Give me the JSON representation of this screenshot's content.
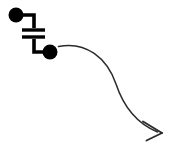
{
  "canvas": {
    "width": 171,
    "height": 157,
    "background_color": "#ffffff",
    "title": "Capacitor symbol with curved arrow"
  },
  "colors": {
    "ink": "#000000",
    "arrow": "#2b2b2b",
    "background": "#ffffff"
  },
  "diagram": {
    "type": "circuit-symbol-with-annotation-arrow",
    "elements": [
      {
        "name": "capacitor-symbol",
        "label": "capacitor",
        "description": "Two parallel horizontal plates with vertical leads"
      },
      {
        "name": "terminal-dot-top-left",
        "label": "terminal node",
        "cx": 16,
        "cy": 15,
        "r": 7.5
      },
      {
        "name": "terminal-dot-bottom-right",
        "label": "terminal node",
        "cx": 50,
        "cy": 52,
        "r": 7.5
      },
      {
        "name": "curved-arrow",
        "label": "pointer arrow",
        "start_x": 58,
        "start_y": 46,
        "end_x": 162,
        "end_y": 133
      }
    ],
    "geometry": {
      "lead_top_path": "M 16 15 L 34 15 L 34 28",
      "lead_bottom_path": "M 34 39 L 34 52 L 50 52",
      "plate_top": {
        "x1": 22,
        "y1": 30,
        "x2": 45,
        "y2": 30
      },
      "plate_bottom": {
        "x1": 22,
        "y1": 37,
        "x2": 45,
        "y2": 37
      },
      "wire_width": 3.6,
      "plate_width": 3.4,
      "arrow_curve": "M 58.5 46.5 C 86 41 107 58 116 84 C 124 108 138 124 157.5 132",
      "arrow_stroke_width": 1.5,
      "arrowhead_upper": "M 143 121.5 L 162 133",
      "arrowhead_lower": "M 146.5 140.5 L 162 133"
    }
  }
}
